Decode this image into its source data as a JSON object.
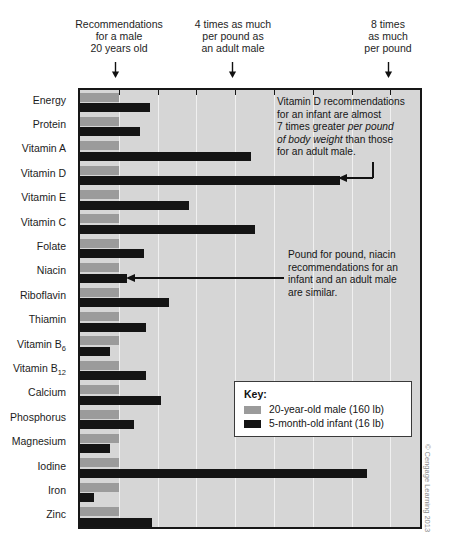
{
  "header": {
    "notes": [
      {
        "text": "Recommendations\nfor a male\n20 years old",
        "value": 1
      },
      {
        "text": "4 times as much\nper pound as\nan adult male",
        "value": 4
      },
      {
        "text": "8 times\nas much\nper pound",
        "value": 8
      }
    ],
    "arrow_icon": "down-arrow-icon"
  },
  "legend": {
    "title": "Key:",
    "entries": [
      {
        "label": "20-year-old male (160 lb)",
        "color": "#9b9b9b"
      },
      {
        "label": "5-month-old infant (16 lb)",
        "color": "#141414"
      }
    ]
  },
  "annotations": [
    {
      "name": "vitamin-d-annotation",
      "lines": [
        {
          "run": "Vitamin D recommendations",
          "italic": false
        },
        {
          "run": "for an infant are almost",
          "italic": false
        },
        {
          "run": "7 times greater ",
          "italic": false,
          "run2": "per pound",
          "italic2": true
        },
        {
          "run": "of body weight",
          "italic": true,
          "run2": " than those",
          "italic2": false
        },
        {
          "run": "for an adult male.",
          "italic": false
        }
      ],
      "text": "Vitamin D recommendations for an infant are almost 7 times greater per pound of body weight than those for an adult male."
    },
    {
      "name": "niacin-annotation",
      "lines": [
        {
          "run": "Pound for pound, niacin",
          "italic": false
        },
        {
          "run": "recommendations for an",
          "italic": false
        },
        {
          "run": "infant and an adult male",
          "italic": false
        },
        {
          "run": "are similar.",
          "italic": false
        }
      ],
      "text": "Pound for pound, niacin recommendations for an infant and an adult male are similar."
    }
  ],
  "credit": "© Cengage Learning 2013",
  "chart_data": {
    "type": "bar",
    "orientation": "horizontal",
    "title": "",
    "xlabel": "Times as much per pound as an adult male",
    "ylabel": "",
    "xlim": [
      0,
      8.8
    ],
    "grid": true,
    "gridlines": [
      1,
      2,
      3,
      4,
      5,
      6,
      7,
      8
    ],
    "legend_position": "inside-bottom-right",
    "categories": [
      "Energy",
      "Protein",
      "Vitamin A",
      "Vitamin D",
      "Vitamin E",
      "Vitamin C",
      "Folate",
      "Niacin",
      "Riboflavin",
      "Thiamin",
      "Vitamin B6",
      "Vitamin B12",
      "Calcium",
      "Phosphorus",
      "Magnesium",
      "Iodine",
      "Iron",
      "Zinc"
    ],
    "series": [
      {
        "name": "20-year-old male (160 lb)",
        "color": "#9b9b9b",
        "values": [
          1,
          1,
          1,
          1,
          1,
          1,
          1,
          1,
          1,
          1,
          1,
          1,
          1,
          1,
          1,
          1,
          1,
          1
        ]
      },
      {
        "name": "5-month-old infant (16 lb)",
        "color": "#141414",
        "values": [
          1.8,
          1.55,
          4.4,
          6.7,
          2.8,
          4.5,
          1.65,
          1.2,
          2.3,
          1.7,
          0.78,
          1.7,
          2.1,
          1.4,
          0.78,
          7.4,
          0.37,
          1.85
        ]
      }
    ]
  },
  "rows": [
    {
      "label": "Energy",
      "sub": "",
      "male": 1,
      "infant": 1.8
    },
    {
      "label": "Protein",
      "sub": "",
      "male": 1,
      "infant": 1.55
    },
    {
      "label": "Vitamin A",
      "sub": "",
      "male": 1,
      "infant": 4.4
    },
    {
      "label": "Vitamin D",
      "sub": "",
      "male": 1,
      "infant": 6.7
    },
    {
      "label": "Vitamin E",
      "sub": "",
      "male": 1,
      "infant": 2.8
    },
    {
      "label": "Vitamin C",
      "sub": "",
      "male": 1,
      "infant": 4.5
    },
    {
      "label": "Folate",
      "sub": "",
      "male": 1,
      "infant": 1.65
    },
    {
      "label": "Niacin",
      "sub": "",
      "male": 1,
      "infant": 1.2
    },
    {
      "label": "Riboflavin",
      "sub": "",
      "male": 1,
      "infant": 2.3
    },
    {
      "label": "Thiamin",
      "sub": "",
      "male": 1,
      "infant": 1.7
    },
    {
      "label": "Vitamin B",
      "sub": "6",
      "male": 1,
      "infant": 0.78
    },
    {
      "label": "Vitamin B",
      "sub": "12",
      "male": 1,
      "infant": 1.7
    },
    {
      "label": "Calcium",
      "sub": "",
      "male": 1,
      "infant": 2.1
    },
    {
      "label": "Phosphorus",
      "sub": "",
      "male": 1,
      "infant": 1.4
    },
    {
      "label": "Magnesium",
      "sub": "",
      "male": 1,
      "infant": 0.78
    },
    {
      "label": "Iodine",
      "sub": "",
      "male": 1,
      "infant": 7.4
    },
    {
      "label": "Iron",
      "sub": "",
      "male": 1,
      "infant": 0.37
    },
    {
      "label": "Zinc",
      "sub": "",
      "male": 1,
      "infant": 1.85
    }
  ]
}
